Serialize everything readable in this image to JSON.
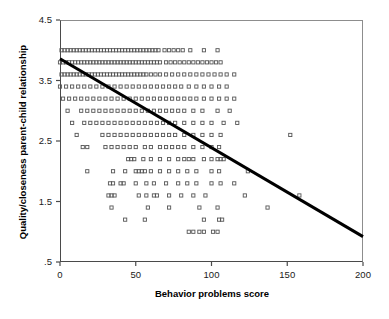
{
  "chart_data": {
    "type": "scatter",
    "title": "",
    "xlabel": "Behavior problems score",
    "ylabel": "Quality/closeness parent-child relationship",
    "xlim": [
      0,
      200
    ],
    "ylim": [
      0.5,
      4.5
    ],
    "xticks": [
      0,
      50,
      100,
      150,
      200
    ],
    "xtick_labels": [
      "0",
      "50",
      "100",
      "150",
      "200"
    ],
    "yticks": [
      0.5,
      1.5,
      2.5,
      3.5,
      4.5
    ],
    "ytick_labels": [
      ".5",
      "1.5",
      "2.5",
      "3.5",
      "4.5"
    ],
    "grid": false,
    "legend": null,
    "marker": "open-square",
    "marker_color": "#555555",
    "trendline": {
      "type": "linear-regression",
      "color": "#000000",
      "width": 3,
      "x_start": 0,
      "y_start": 3.86,
      "x_end": 200,
      "y_end": 0.92,
      "slope": -0.0147,
      "intercept": 3.86
    },
    "y_levels": [
      4.0,
      3.8,
      3.6,
      3.4,
      3.2,
      3.0,
      2.8,
      2.6,
      2.4,
      2.2,
      2.0,
      1.8,
      1.6,
      1.4,
      1.2,
      1.0
    ],
    "points": [
      {
        "y": 4.0,
        "x": [
          1,
          3,
          5,
          7,
          9,
          11,
          13,
          15,
          17,
          19,
          21,
          23,
          25,
          27,
          29,
          31,
          33,
          35,
          37,
          39,
          41,
          43,
          45,
          47,
          49,
          51,
          53,
          55,
          57,
          59,
          61,
          63,
          65,
          69,
          72,
          75,
          78,
          81,
          86,
          95,
          104
        ]
      },
      {
        "y": 3.8,
        "x": [
          0,
          2,
          4,
          6,
          8,
          10,
          12,
          14,
          16,
          18,
          20,
          22,
          24,
          26,
          28,
          30,
          32,
          34,
          36,
          38,
          40,
          42,
          44,
          46,
          48,
          50,
          52,
          54,
          56,
          58,
          60,
          62,
          64,
          66,
          70,
          73,
          76,
          79,
          82,
          85,
          88,
          91,
          94,
          97,
          100,
          103,
          106
        ]
      },
      {
        "y": 3.6,
        "x": [
          1,
          3,
          5,
          7,
          9,
          11,
          13,
          15,
          17,
          19,
          21,
          23,
          25,
          27,
          29,
          31,
          33,
          35,
          37,
          39,
          41,
          43,
          45,
          47,
          49,
          51,
          53,
          55,
          57,
          60,
          63,
          66,
          70,
          74,
          78,
          82,
          86,
          90,
          94,
          98,
          102,
          106,
          110,
          115
        ]
      },
      {
        "y": 3.4,
        "x": [
          0,
          4,
          8,
          12,
          16,
          20,
          24,
          28,
          32,
          36,
          40,
          44,
          48,
          52,
          56,
          60,
          64,
          68,
          72,
          76,
          80,
          85,
          90,
          95,
          100,
          105,
          110
        ]
      },
      {
        "y": 3.2,
        "x": [
          2,
          6,
          10,
          14,
          18,
          22,
          26,
          30,
          34,
          38,
          42,
          46,
          50,
          54,
          58,
          62,
          66,
          70,
          74,
          78,
          82,
          86,
          90,
          95,
          100,
          105,
          110,
          115
        ]
      },
      {
        "y": 3.0,
        "x": [
          5,
          14,
          18,
          22,
          26,
          30,
          34,
          38,
          42,
          46,
          50,
          54,
          58,
          62,
          66,
          70,
          74,
          78,
          82,
          88,
          94,
          104,
          112
        ]
      },
      {
        "y": 2.8,
        "x": [
          8,
          16,
          20,
          24,
          28,
          32,
          36,
          40,
          44,
          48,
          52,
          56,
          60,
          64,
          68,
          72,
          76,
          82,
          88,
          94,
          100,
          108,
          117
        ]
      },
      {
        "y": 2.6,
        "x": [
          11,
          28,
          32,
          36,
          40,
          44,
          48,
          52,
          56,
          60,
          64,
          68,
          72,
          76,
          82,
          88,
          94,
          100,
          106,
          152
        ]
      },
      {
        "y": 2.4,
        "x": [
          15,
          18,
          30,
          34,
          38,
          42,
          46,
          50,
          56,
          60,
          66,
          70,
          74,
          78,
          82,
          88,
          94,
          100,
          105
        ]
      },
      {
        "y": 2.2,
        "x": [
          45,
          47,
          49,
          55,
          60,
          66,
          72,
          78,
          82,
          85,
          88,
          95,
          100,
          104,
          106,
          108
        ]
      },
      {
        "y": 2.0,
        "x": [
          18,
          35,
          43,
          50,
          52,
          54,
          56,
          60,
          66,
          72,
          78,
          84,
          90,
          100,
          105,
          124
        ]
      },
      {
        "y": 1.8,
        "x": [
          33,
          35,
          40,
          42,
          50,
          57,
          62,
          70,
          78,
          84,
          90,
          100,
          106,
          115
        ]
      },
      {
        "y": 1.6,
        "x": [
          32,
          34,
          36,
          52,
          57,
          62,
          64,
          72,
          80,
          88,
          96,
          122,
          158
        ]
      },
      {
        "y": 1.4,
        "x": [
          34,
          58,
          72,
          92,
          104,
          137
        ]
      },
      {
        "y": 1.2,
        "x": [
          43,
          56,
          95,
          105,
          107
        ]
      },
      {
        "y": 1.0,
        "x": [
          85,
          88,
          92,
          95,
          101,
          104
        ]
      }
    ]
  },
  "axes": {
    "x_axis_name": "x-axis",
    "y_axis_name": "y-axis"
  }
}
